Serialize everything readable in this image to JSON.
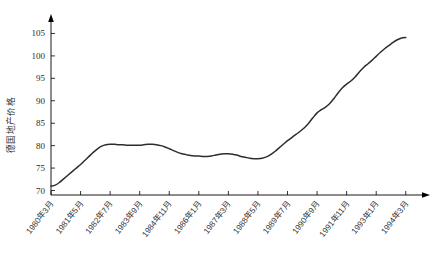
{
  "chart_data": {
    "type": "line",
    "title": "",
    "subtitle": "",
    "xlabel": "",
    "ylabel": "德国地产价格",
    "ylim": [
      69,
      108
    ],
    "xlim": [
      0,
      170
    ],
    "grid": false,
    "legend": null,
    "y_ticks": [
      70,
      75,
      80,
      85,
      90,
      95,
      100,
      105
    ],
    "x_tick_labels": [
      "1980年3月",
      "1981年5月",
      "1982年7月",
      "1983年9月",
      "1984年11月",
      "1986年1月",
      "1987年3月",
      "1988年5月",
      "1989年7月",
      "1990年9月",
      "1991年11月",
      "1993年1月",
      "1994年3月"
    ],
    "x_tick_months": [
      0,
      14,
      28,
      42,
      56,
      70,
      84,
      98,
      112,
      126,
      140,
      154,
      168
    ],
    "series": [
      {
        "name": "德国地产价格",
        "color": "#2d2d2d",
        "x": [
          0,
          2,
          4,
          6,
          8,
          10,
          12,
          14,
          16,
          18,
          20,
          22,
          24,
          26,
          28,
          30,
          32,
          34,
          36,
          38,
          40,
          42,
          44,
          46,
          48,
          50,
          52,
          54,
          56,
          58,
          60,
          62,
          64,
          66,
          68,
          70,
          72,
          74,
          76,
          78,
          80,
          82,
          84,
          86,
          88,
          90,
          92,
          94,
          96,
          98,
          100,
          102,
          104,
          106,
          108,
          110,
          112,
          114,
          116,
          118,
          120,
          122,
          124,
          126,
          128,
          130,
          132,
          134,
          136,
          138,
          140,
          142,
          144,
          146,
          148,
          150,
          152,
          154,
          156,
          158,
          160,
          162,
          164,
          166,
          168
        ],
        "values": [
          71.0,
          71.2,
          71.8,
          72.6,
          73.4,
          74.2,
          75.0,
          75.8,
          76.7,
          77.6,
          78.5,
          79.3,
          79.9,
          80.2,
          80.3,
          80.3,
          80.2,
          80.2,
          80.1,
          80.1,
          80.1,
          80.1,
          80.2,
          80.3,
          80.3,
          80.2,
          80.0,
          79.7,
          79.3,
          78.9,
          78.5,
          78.2,
          78.0,
          77.8,
          77.7,
          77.7,
          77.6,
          77.6,
          77.7,
          77.9,
          78.1,
          78.2,
          78.2,
          78.1,
          77.9,
          77.6,
          77.4,
          77.2,
          77.1,
          77.1,
          77.2,
          77.5,
          78.0,
          78.7,
          79.5,
          80.3,
          81.1,
          81.8,
          82.5,
          83.2,
          84.0,
          85.0,
          86.2,
          87.3,
          88.0,
          88.6,
          89.4,
          90.5,
          91.8,
          92.9,
          93.7,
          94.4,
          95.3,
          96.4,
          97.4,
          98.2,
          99.0,
          99.9,
          100.8,
          101.6,
          102.3,
          103.0,
          103.6,
          104.0,
          104.1
        ]
      }
    ]
  }
}
